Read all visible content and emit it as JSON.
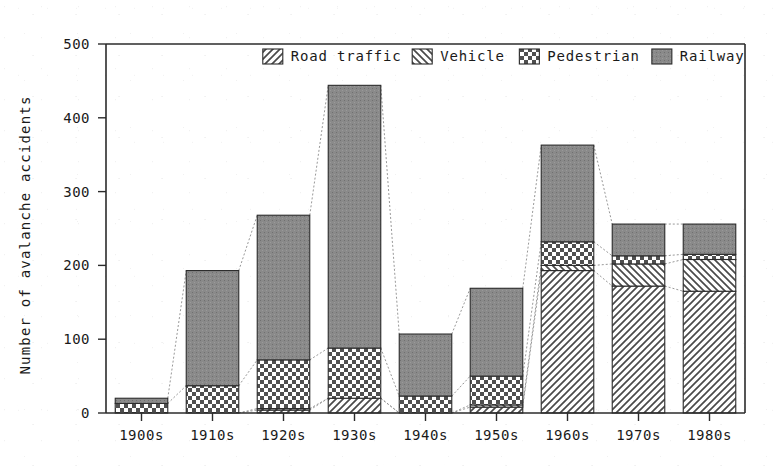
{
  "chart_data": {
    "type": "bar",
    "stacked": true,
    "title": "",
    "subtitle": "",
    "xlabel": "",
    "ylabel": "Number of avalanche accidents",
    "categories": [
      "1900s",
      "1910s",
      "1920s",
      "1930s",
      "1940s",
      "1950s",
      "1960s",
      "1970s",
      "1980s"
    ],
    "ylim": [
      0,
      500
    ],
    "yticks": [
      0,
      100,
      200,
      300,
      400,
      500
    ],
    "ytick_labels": [
      "0",
      "100",
      "200",
      "300",
      "400",
      "500"
    ],
    "grid": false,
    "legend_position": "top-right",
    "series": [
      {
        "name": "Road traffic",
        "pattern": "diagonal-forward",
        "color": "#d8d8d8",
        "values": [
          0,
          0,
          4,
          20,
          0,
          8,
          193,
          172,
          165
        ]
      },
      {
        "name": "Vehicle",
        "pattern": "diagonal-back",
        "color": "#e2e2e2",
        "values": [
          0,
          0,
          2,
          0,
          0,
          3,
          7,
          30,
          43
        ]
      },
      {
        "name": "Pedestrian",
        "pattern": "checker",
        "color": "#cfcfcf",
        "values": [
          13,
          37,
          66,
          68,
          23,
          39,
          32,
          11,
          7
        ]
      },
      {
        "name": "Railway",
        "pattern": "solid-gray",
        "color": "#8a8a8a",
        "values": [
          7,
          156,
          196,
          356,
          84,
          119,
          131,
          43,
          41
        ]
      }
    ],
    "totals": [
      20,
      193,
      268,
      444,
      107,
      169,
      363,
      256,
      256
    ],
    "annotations": "Thin dotted connector lines join corresponding stack boundaries between adjacent bars."
  },
  "legend": {
    "items": [
      {
        "label": "Road traffic",
        "swatch": "road-traffic-swatch"
      },
      {
        "label": "Vehicle",
        "swatch": "vehicle-swatch"
      },
      {
        "label": "Pedestrian",
        "swatch": "pedestrian-swatch"
      },
      {
        "label": "Railway",
        "swatch": "railway-swatch"
      }
    ]
  },
  "axes": {
    "y_axis_label": "Number of avalanche accidents",
    "y_tick_0": "0",
    "y_tick_1": "100",
    "y_tick_2": "200",
    "y_tick_3": "300",
    "y_tick_4": "400",
    "y_tick_5": "500",
    "x_tick_0": "1900s",
    "x_tick_1": "1910s",
    "x_tick_2": "1920s",
    "x_tick_3": "1930s",
    "x_tick_4": "1940s",
    "x_tick_5": "1950s",
    "x_tick_6": "1960s",
    "x_tick_7": "1970s",
    "x_tick_8": "1980s"
  },
  "colors": {
    "ink": "#1a1a1a",
    "axis": "#2b2b2b",
    "railway": "#8a8a8a",
    "pedestrian": "#cfcfcf",
    "road_traffic": "#d8d8d8",
    "vehicle": "#e2e2e2",
    "connector": "#8d8d8d",
    "background": "#ffffff"
  }
}
